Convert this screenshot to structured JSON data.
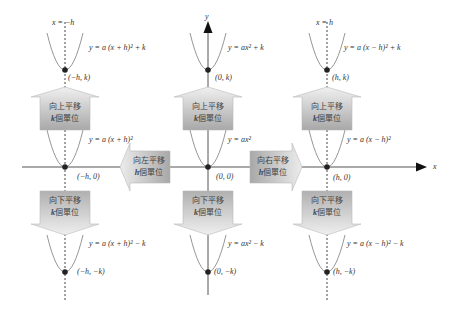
{
  "diagram": {
    "colors": {
      "axis": "#555555",
      "curve": "#8a8a8a",
      "vertex": "#222222",
      "arrow_fill_light": "#e4e4e4",
      "arrow_fill_dark": "#9a9a9a",
      "text": "#333333"
    },
    "axes": {
      "x_label": "x",
      "y_label": "y"
    },
    "guides": {
      "left": "x = −h",
      "right": "x = h"
    },
    "equations": {
      "left_top": "y = a (x + h)² + k",
      "left_mid": "y = a (x + h)²",
      "left_bottom": "y = a (x + h)² − k",
      "center_top": "y = ax² + k",
      "center_mid": "y = ax²",
      "center_bottom": "y = ax² − k",
      "right_top": "y = a (x − h)² + k",
      "right_mid": "y = a (x − h)²",
      "right_bottom": "y = a (x − h)² − k"
    },
    "vertices": {
      "left_top": "(−h, k)",
      "left_mid": "(−h, 0)",
      "left_bottom": "(−h, −k)",
      "center_top": "(0, k)",
      "center_mid": "(0, 0)",
      "center_bottom": "(0, −k)",
      "right_top": "(h, k)",
      "right_mid": "(h, 0)",
      "right_bottom": "(h, −k)"
    },
    "arrows": {
      "up": {
        "line1": "向上平移",
        "k": "k",
        "line2": "個單位"
      },
      "down": {
        "line1": "向下平移",
        "k": "k",
        "line2": "個單位"
      },
      "left": {
        "line1": "向左平移",
        "k": "h",
        "line2": "個單位"
      },
      "right": {
        "line1": "向右平移",
        "k": "h",
        "line2": "個單位"
      }
    }
  }
}
